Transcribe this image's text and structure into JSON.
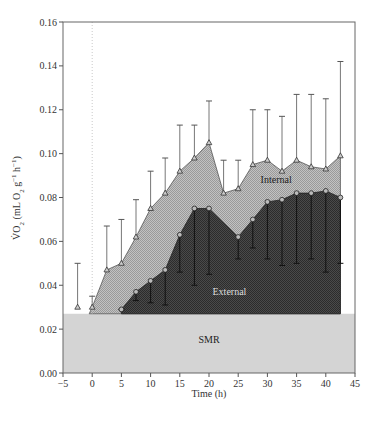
{
  "chart_data": {
    "type": "area",
    "title": "",
    "xlabel": "Time (h)",
    "ylabel": "V̇O₂ (mL O₂ g⁻¹ h⁻¹)",
    "xlim": [
      -5,
      45
    ],
    "ylim": [
      0.0,
      0.16
    ],
    "xticks": [
      -5,
      0,
      5,
      10,
      15,
      20,
      25,
      30,
      35,
      40,
      45
    ],
    "yticks": [
      0.0,
      0.02,
      0.04,
      0.06,
      0.08,
      0.1,
      0.12,
      0.14,
      0.16
    ],
    "xtick_labels": [
      "−5",
      "0",
      "5",
      "10",
      "15",
      "20",
      "25",
      "30",
      "35",
      "40",
      "45"
    ],
    "ytick_labels": [
      "0.00",
      "0.02",
      "0.04",
      "0.06",
      "0.08",
      "0.10",
      "0.12",
      "0.14",
      "0.16"
    ],
    "grid": false,
    "vertical_reference_line_x": 0,
    "smr": {
      "name": "SMR",
      "value": 0.027,
      "color": "#d4d4d4"
    },
    "series": [
      {
        "name": "Internal",
        "marker": "triangle",
        "fill_color": "#b4b4b4",
        "error_direction": "up",
        "x": [
          -2.5,
          0,
          2.5,
          5,
          7.5,
          10,
          12.5,
          15,
          17.5,
          20,
          22.5,
          25,
          27.5,
          30,
          32.5,
          35,
          37.5,
          40,
          42.5
        ],
        "values": [
          0.03,
          0.03,
          0.047,
          0.05,
          0.062,
          0.075,
          0.082,
          0.092,
          0.098,
          0.105,
          0.082,
          0.084,
          0.095,
          0.097,
          0.092,
          0.097,
          0.094,
          0.093,
          0.099
        ],
        "error_upper": [
          0.05,
          0.035,
          0.067,
          0.07,
          0.079,
          0.092,
          0.098,
          0.113,
          0.113,
          0.124,
          0.097,
          0.097,
          0.12,
          0.12,
          0.117,
          0.127,
          0.127,
          0.125,
          0.142
        ]
      },
      {
        "name": "External",
        "marker": "circle",
        "fill_color": "#3c3c3c",
        "error_direction": "down",
        "x": [
          5,
          7.5,
          10,
          12.5,
          15,
          17.5,
          20,
          25,
          27.5,
          30,
          32.5,
          35,
          37.5,
          40,
          42.5
        ],
        "values": [
          0.029,
          0.037,
          0.042,
          0.047,
          0.063,
          0.075,
          0.075,
          0.062,
          0.07,
          0.078,
          0.079,
          0.082,
          0.082,
          0.083,
          0.08
        ],
        "error_lower": [
          0.029,
          0.033,
          0.032,
          0.031,
          0.046,
          0.04,
          0.045,
          0.052,
          0.057,
          0.052,
          0.049,
          0.05,
          0.052,
          0.046,
          0.05
        ]
      }
    ],
    "annotations": [
      {
        "text": "Internal",
        "x": 31.5,
        "y": 0.0865
      },
      {
        "text": "External",
        "x": 23.5,
        "y": 0.0355
      },
      {
        "text": "SMR",
        "x": 20,
        "y": 0.0135
      }
    ]
  },
  "labels": {
    "xlabel": "Time (h)",
    "internal": "Internal",
    "external": "External",
    "smr": "SMR"
  }
}
